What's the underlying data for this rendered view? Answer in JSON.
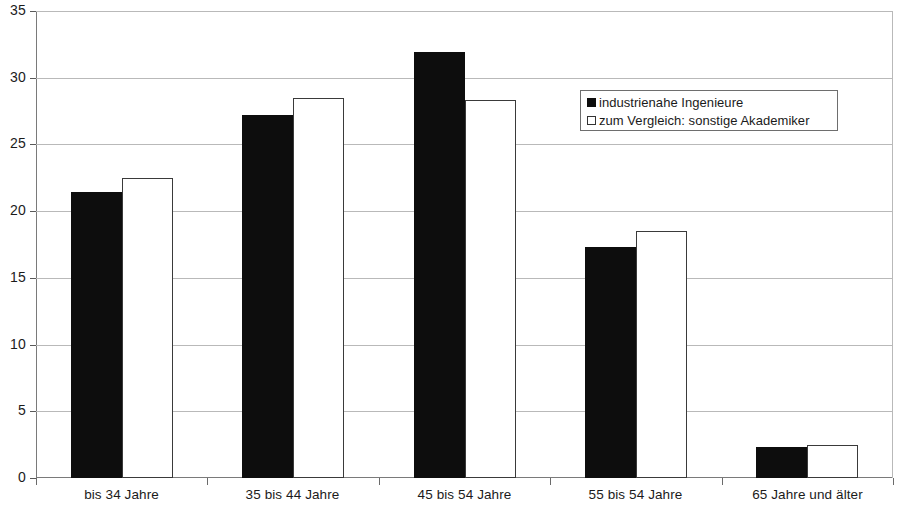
{
  "chart_data": {
    "type": "bar",
    "title": "",
    "subtitle": "",
    "xlabel": "",
    "ylabel": "",
    "ylim": [
      0,
      35
    ],
    "yticks": [
      0,
      5,
      10,
      15,
      20,
      25,
      30,
      35
    ],
    "ytick_labels": [
      "0",
      "5",
      "10",
      "15",
      "20",
      "25",
      "30",
      "35"
    ],
    "grid": true,
    "legend_position": "inside-upper-right",
    "categories": [
      "bis 34 Jahre",
      "35 bis 44 Jahre",
      "45 bis 54 Jahre",
      "55 bis 54 Jahre",
      "65 Jahre und älter"
    ],
    "series": [
      {
        "name": "industrienahe Ingenieure",
        "color": "#0d0d0d",
        "values": [
          21.4,
          27.2,
          31.9,
          17.3,
          2.3
        ]
      },
      {
        "name": "zum Vergleich: sonstige Akademiker",
        "color": "#ffffff",
        "values": [
          22.5,
          28.5,
          28.3,
          18.5,
          2.5
        ]
      }
    ]
  },
  "legend": {
    "entries": [
      {
        "label": "industrienahe Ingenieure",
        "swatch": "filled-black-square-icon"
      },
      {
        "label": "zum Vergleich: sonstige Akademiker",
        "swatch": "outlined-white-square-icon"
      }
    ]
  },
  "axis": {
    "y_tick_labels": [
      "35",
      "30",
      "25",
      "20",
      "15",
      "10",
      "5",
      "0"
    ],
    "x_tick_labels": [
      "bis 34 Jahre",
      "35 bis 44 Jahre",
      "45 bis 54 Jahre",
      "55 bis 54 Jahre",
      "65 Jahre und älter"
    ]
  },
  "colors": {
    "series_a": "#0d0d0d",
    "series_b": "#ffffff",
    "series_b_border": "#3a3a3a",
    "gridline": "#b9b9b9",
    "axis": "#7a7a7a",
    "text": "#1b1b1b",
    "background": "#ffffff"
  }
}
